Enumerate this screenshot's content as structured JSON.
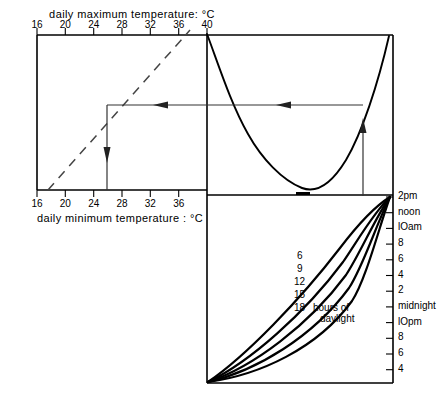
{
  "figure": {
    "type": "nomogram"
  },
  "left_panel": {
    "top_axis": {
      "title": "daily maximum  temperature: °C",
      "ticks": [
        "16",
        "20",
        "24",
        "28",
        "32",
        "36",
        "40"
      ],
      "values": [
        16,
        20,
        24,
        28,
        32,
        36,
        40
      ],
      "min": 16,
      "max": 40
    },
    "bottom_axis": {
      "title": "daily minimum  temperature : °C",
      "ticks": [
        "16",
        "20",
        "24",
        "28",
        "32",
        "36"
      ],
      "values": [
        16,
        20,
        24,
        28,
        32,
        36
      ],
      "min": 16,
      "max": 40
    },
    "diagonal_line_style": "dashed",
    "reading_arrow_value": 27.5
  },
  "right_axis": {
    "labels": [
      "2pm",
      "noon",
      "lOam",
      "8",
      "6",
      "4",
      "2",
      "midnight",
      "lOpm",
      "8",
      "6",
      "4"
    ]
  },
  "daylight_curves": {
    "labels": [
      "6",
      "9",
      "12",
      "15",
      "18"
    ],
    "caption_line1": "hours of",
    "caption_line2": "daylight"
  },
  "colors": {
    "ink": "#000000",
    "background": "#ffffff",
    "arrow": "#3a3a3a"
  }
}
